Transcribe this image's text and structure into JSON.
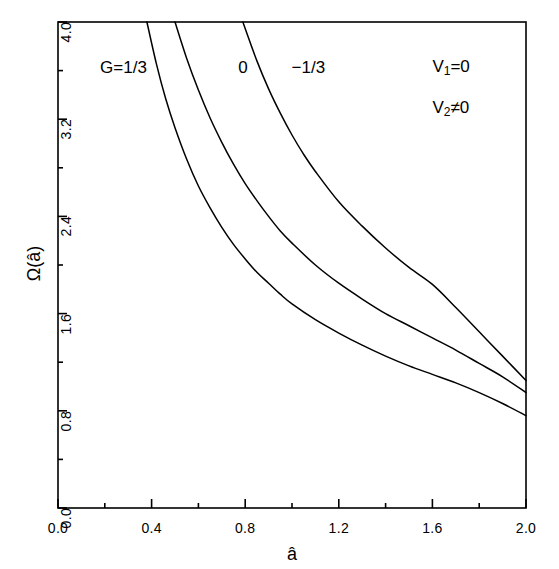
{
  "chart_data": {
    "type": "line",
    "title": "",
    "xlabel": "â",
    "ylabel": "Ω(â)",
    "xlim": [
      0.0,
      2.0
    ],
    "ylim": [
      0.0,
      4.0
    ],
    "grid": false,
    "legend_position": "inline-curve-labels",
    "x_ticks": [
      "0.0",
      "0.4",
      "0.8",
      "1.2",
      "1.6",
      "2.0"
    ],
    "x_tick_values": [
      0.0,
      0.4,
      0.8,
      1.2,
      1.6,
      2.0
    ],
    "x_minor_interval": 0.2,
    "y_ticks": [
      "0.0",
      "0.8",
      "1.6",
      "2.4",
      "3.2",
      "4.0"
    ],
    "y_tick_values": [
      0.0,
      0.8,
      1.6,
      2.4,
      3.2,
      4.0
    ],
    "y_minor_interval": 0.4,
    "line_color": "#000000",
    "series": [
      {
        "name": "G=1/3",
        "label": "G=1/3",
        "label_x": 0.28,
        "label_y": 3.62,
        "x": [
          0.38,
          0.42,
          0.46,
          0.5,
          0.55,
          0.6,
          0.65,
          0.7,
          0.75,
          0.8,
          0.85,
          0.9,
          0.95,
          1.0,
          1.1,
          1.2,
          1.3,
          1.4,
          1.5,
          1.6,
          1.7,
          1.8,
          1.9,
          2.0
        ],
        "y": [
          4.0,
          3.66,
          3.37,
          3.13,
          2.87,
          2.65,
          2.47,
          2.31,
          2.17,
          2.05,
          1.94,
          1.85,
          1.76,
          1.68,
          1.55,
          1.44,
          1.34,
          1.25,
          1.17,
          1.1,
          1.03,
          0.95,
          0.86,
          0.76
        ]
      },
      {
        "name": "0",
        "label": "0",
        "label_x": 0.79,
        "label_y": 3.62,
        "x": [
          0.5,
          0.55,
          0.6,
          0.65,
          0.7,
          0.75,
          0.8,
          0.85,
          0.9,
          0.95,
          1.0,
          1.1,
          1.2,
          1.3,
          1.4,
          1.5,
          1.6,
          1.7,
          1.8,
          1.9,
          2.0
        ],
        "y": [
          4.0,
          3.7,
          3.44,
          3.21,
          3.01,
          2.83,
          2.67,
          2.53,
          2.4,
          2.28,
          2.18,
          2.0,
          1.85,
          1.72,
          1.6,
          1.5,
          1.4,
          1.3,
          1.19,
          1.08,
          0.95
        ]
      },
      {
        "name": "-1/3",
        "label": "−1/3",
        "label_x": 1.07,
        "label_y": 3.62,
        "x": [
          0.79,
          0.85,
          0.9,
          0.95,
          1.0,
          1.05,
          1.1,
          1.2,
          1.3,
          1.4,
          1.5,
          1.6,
          1.7,
          1.8,
          1.9,
          2.0
        ],
        "y": [
          4.0,
          3.68,
          3.45,
          3.25,
          3.07,
          2.91,
          2.77,
          2.52,
          2.32,
          2.14,
          1.98,
          1.84,
          1.65,
          1.45,
          1.25,
          1.05
        ]
      }
    ],
    "annotations": [
      {
        "id": "v1",
        "text_main": "V",
        "sub": "1",
        "text_tail": "=0",
        "x": 1.6,
        "y": 3.62
      },
      {
        "id": "v2",
        "text_main": "V",
        "sub": "2",
        "text_tail": "≠0",
        "x": 1.6,
        "y": 3.28
      }
    ]
  }
}
